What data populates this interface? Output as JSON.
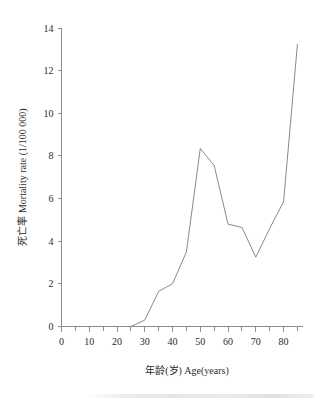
{
  "chart_data": {
    "type": "line",
    "title": "",
    "subtitle": "",
    "xlabel": "年龄(岁) Age(years)",
    "ylabel": "死亡率 Mortality rate (1/100 000)",
    "xlim": [
      0,
      87
    ],
    "ylim": [
      0,
      14
    ],
    "xticks": [
      0,
      10,
      20,
      30,
      40,
      50,
      60,
      70,
      80
    ],
    "xtick_labels": [
      "0",
      "10",
      "20",
      "30",
      "40",
      "50",
      "60",
      "70",
      "80"
    ],
    "xminor_ticks": [
      5,
      15,
      25,
      35,
      45,
      55,
      65,
      75,
      85
    ],
    "yticks": [
      0,
      2,
      4,
      6,
      8,
      10,
      12,
      14
    ],
    "ytick_labels": [
      "0",
      "2",
      "4",
      "6",
      "8",
      "10",
      "12",
      "14"
    ],
    "grid": false,
    "legend": false,
    "legend_position": "none",
    "line_color": "#8a8a8a",
    "axis_color": "#8d8d8d",
    "background_color": "#ffffff",
    "x": [
      25,
      30,
      35,
      40,
      45,
      50,
      55,
      60,
      65,
      70,
      75,
      80,
      85
    ],
    "values": [
      0.0,
      0.3,
      1.65,
      2.0,
      3.5,
      8.35,
      7.55,
      4.8,
      4.65,
      3.25,
      4.6,
      5.85,
      13.25
    ],
    "series": [
      {
        "name": "死亡率 Mortality rate",
        "x": [
          25,
          30,
          35,
          40,
          45,
          50,
          55,
          60,
          65,
          70,
          75,
          80,
          85
        ],
        "values": [
          0.0,
          0.3,
          1.65,
          2.0,
          3.5,
          8.35,
          7.55,
          4.8,
          4.65,
          3.25,
          4.6,
          5.85,
          13.25
        ]
      }
    ],
    "annotations": []
  },
  "axes": {
    "x_axis_name": "age-axis",
    "y_axis_name": "mortality-axis"
  }
}
